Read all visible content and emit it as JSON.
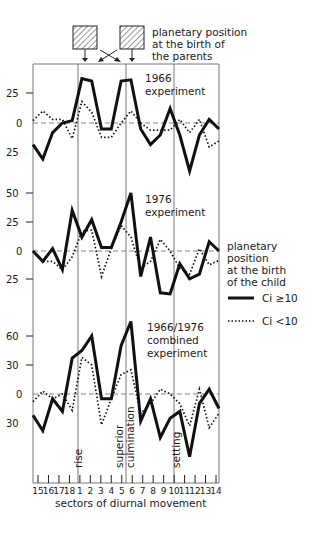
{
  "chart_data": [
    {
      "type": "line",
      "title": "1966 experiment",
      "categories": [
        "15",
        "16",
        "17",
        "18",
        "1",
        "2",
        "3",
        "4",
        "5",
        "6",
        "7",
        "8",
        "9",
        "10",
        "11",
        "12",
        "13",
        "14"
      ],
      "yticks": [
        "25",
        "0",
        "25"
      ],
      "ylim": [
        -35,
        40
      ],
      "series": [
        {
          "name": "Ci ≥ 10",
          "style": "solid",
          "values": [
            -18,
            -30,
            -8,
            0,
            2,
            37,
            35,
            -5,
            -5,
            35,
            36,
            -5,
            -18,
            -10,
            12,
            -10,
            -40,
            -10,
            3,
            -5
          ]
        },
        {
          "name": "Ci < 10",
          "style": "dotted",
          "values": [
            2,
            10,
            3,
            3,
            -13,
            18,
            9,
            -12,
            -12,
            0,
            10,
            0,
            -6,
            -6,
            -6,
            3,
            -8,
            3,
            -20,
            -15
          ]
        }
      ]
    },
    {
      "type": "line",
      "title": "1976 experiment",
      "categories": [
        "15",
        "16",
        "17",
        "18",
        "1",
        "2",
        "3",
        "4",
        "5",
        "6",
        "7",
        "8",
        "9",
        "10",
        "11",
        "12",
        "13",
        "14"
      ],
      "yticks": [
        "50",
        "25",
        "0",
        "25"
      ],
      "ylim": [
        -40,
        55
      ],
      "series": [
        {
          "name": "Ci ≥ 10",
          "style": "solid",
          "values": [
            0,
            -9,
            2,
            -16,
            35,
            12,
            27,
            3,
            3,
            25,
            50,
            -22,
            12,
            -36,
            -37,
            -11,
            -24,
            -20,
            8,
            0
          ]
        },
        {
          "name": "Ci < 10",
          "style": "dotted",
          "values": [
            0,
            -9,
            -9,
            -16,
            -5,
            17,
            18,
            -22,
            2,
            22,
            12,
            -15,
            -9,
            10,
            0,
            -15,
            -20,
            2,
            -12,
            -8
          ]
        }
      ]
    },
    {
      "type": "line",
      "title": "1966/1976 combined experiment",
      "categories": [
        "15",
        "16",
        "17",
        "18",
        "1",
        "2",
        "3",
        "4",
        "5",
        "6",
        "7",
        "8",
        "9",
        "10",
        "11",
        "12",
        "13",
        "14"
      ],
      "yticks": [
        "60",
        "30",
        "0",
        "30"
      ],
      "ylim": [
        -65,
        80
      ],
      "series": [
        {
          "name": "Ci ≥ 10",
          "style": "solid",
          "values": [
            -22,
            -38,
            -5,
            -18,
            37,
            45,
            60,
            -5,
            -5,
            50,
            75,
            -28,
            -5,
            -45,
            -25,
            -18,
            -65,
            -10,
            5,
            -15
          ]
        },
        {
          "name": "Ci < 10",
          "style": "dotted",
          "values": [
            -8,
            3,
            -5,
            0,
            -17,
            38,
            30,
            -32,
            -5,
            20,
            25,
            -20,
            -10,
            5,
            0,
            -10,
            -33,
            5,
            -35,
            -20
          ]
        }
      ]
    }
  ],
  "header": {
    "parents_label_line1": "planetary position",
    "parents_label_line2": "at the birth of",
    "parents_label_line3": "the parents"
  },
  "panels": [
    {
      "title_line1": "1966",
      "title_line2": "experiment",
      "ticks": [
        "25",
        "0",
        "25"
      ]
    },
    {
      "title_line1": "1976",
      "title_line2": "experiment",
      "ticks": [
        "50",
        "25",
        "0",
        "25"
      ]
    },
    {
      "title_line1": "1966/1976",
      "title_line2": "combined",
      "title_line3": "experiment",
      "ticks": [
        "60",
        "30",
        "0",
        "30"
      ]
    }
  ],
  "legend": {
    "title_line1": "planetary",
    "title_line2": "position",
    "title_line3": "at the birth",
    "title_line4": "of the child",
    "solid_label": "Ci ≥10",
    "dotted_label": "Ci <10"
  },
  "annotations": {
    "rise": "rise",
    "culmination_line1": "superior",
    "culmination_line2": "culmination",
    "setting": "setting"
  },
  "xaxis": {
    "labels": [
      "15",
      "16",
      "17",
      "18",
      "1",
      "2",
      "3",
      "4",
      "5",
      "6",
      "7",
      "8",
      "9",
      "10",
      "11",
      "12",
      "13",
      "14"
    ],
    "title": "sectors of diurnal movement"
  }
}
